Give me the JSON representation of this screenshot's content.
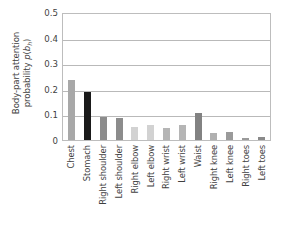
{
  "chart_data": {
    "type": "bar",
    "title": "",
    "xlabel": "",
    "ylabel_line1": "Body-part attention",
    "ylabel_line2_prefix": "probability ",
    "ylabel_line2_math_p": "p",
    "ylabel_line2_math_open": "(",
    "ylabel_line2_math_b": "b",
    "ylabel_line2_math_sub": "h",
    "ylabel_line2_math_close": ")",
    "ylim": [
      0,
      0.5
    ],
    "ytick_labels": [
      "0.5",
      "0.4",
      "0.3",
      "0.2",
      "0.1",
      "0"
    ],
    "ytick_values": [
      0.5,
      0.4,
      0.3,
      0.2,
      0.1,
      0
    ],
    "grid": "horizontal",
    "legend": "none",
    "categories": [
      "Chest",
      "Stomach",
      "Right shoulder",
      "Left shoulder",
      "Right elbow",
      "Left elbow",
      "Right wrist",
      "Left wrist",
      "Waist",
      "Right knee",
      "Left knee",
      "Right toes",
      "Left toes"
    ],
    "values": [
      0.235,
      0.187,
      0.09,
      0.087,
      0.052,
      0.057,
      0.048,
      0.057,
      0.107,
      0.028,
      0.032,
      0.007,
      0.01
    ],
    "bar_colors": [
      "#a8a8a8",
      "#1a1a1a",
      "#8c8c8c",
      "#8c8c8c",
      "#d2d2d2",
      "#d2d2d2",
      "#b5b5b5",
      "#b5b5b5",
      "#828282",
      "#b0b0b0",
      "#9a9a9a",
      "#9a9a9a",
      "#8a8a8a"
    ],
    "axis_color": "#bdbdbd",
    "gridline_color": "#b9b9b9",
    "text_color": "#3f3f3f",
    "background": "#ffffff"
  }
}
